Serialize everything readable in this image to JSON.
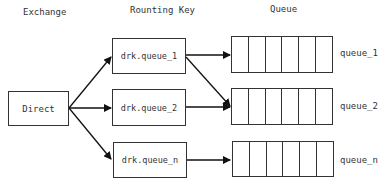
{
  "headers": {
    "exchange": "Exchange",
    "routing_key": "Rounting Key",
    "queue": "Queue"
  },
  "exchange": {
    "label": "Direct"
  },
  "routing_keys": [
    {
      "label": "drk.queue_1"
    },
    {
      "label": "drk.queue_2"
    },
    {
      "label": "drk.queue_n"
    }
  ],
  "queues": [
    {
      "label": "queue_1",
      "cells": 6
    },
    {
      "label": "queue_2",
      "cells": 6
    },
    {
      "label": "queue_n",
      "cells": 6
    }
  ],
  "edges": [
    {
      "from": "Direct",
      "to": "drk.queue_1"
    },
    {
      "from": "Direct",
      "to": "drk.queue_2"
    },
    {
      "from": "Direct",
      "to": "drk.queue_n"
    },
    {
      "from": "drk.queue_1",
      "to": "queue_1"
    },
    {
      "from": "drk.queue_1",
      "to": "queue_2"
    },
    {
      "from": "drk.queue_2",
      "to": "queue_2"
    },
    {
      "from": "drk.queue_n",
      "to": "queue_n"
    }
  ]
}
